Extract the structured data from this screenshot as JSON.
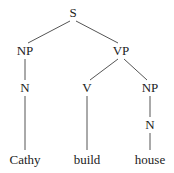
{
  "diagram": {
    "type": "syntax-tree",
    "nodes": [
      {
        "id": "S",
        "label": "S",
        "x": 73,
        "y": 17
      },
      {
        "id": "NP1",
        "label": "NP",
        "x": 25,
        "y": 55
      },
      {
        "id": "VP",
        "label": "VP",
        "x": 121,
        "y": 55
      },
      {
        "id": "N1",
        "label": "N",
        "x": 25,
        "y": 92
      },
      {
        "id": "V",
        "label": "V",
        "x": 87,
        "y": 92
      },
      {
        "id": "NP2",
        "label": "NP",
        "x": 150,
        "y": 92
      },
      {
        "id": "N2",
        "label": "N",
        "x": 150,
        "y": 129
      },
      {
        "id": "W1",
        "label": "Cathy",
        "x": 25,
        "y": 164
      },
      {
        "id": "W2",
        "label": "build",
        "x": 87,
        "y": 164
      },
      {
        "id": "W3",
        "label": "house",
        "x": 150,
        "y": 164
      }
    ],
    "edges": [
      {
        "from": "S",
        "to": "NP1",
        "x1": 70,
        "y1": 21,
        "x2": 28,
        "y2": 43
      },
      {
        "from": "S",
        "to": "VP",
        "x1": 76,
        "y1": 21,
        "x2": 118,
        "y2": 43
      },
      {
        "from": "NP1",
        "to": "N1",
        "x1": 25,
        "y1": 59,
        "x2": 25,
        "y2": 80
      },
      {
        "from": "VP",
        "to": "V",
        "x1": 118,
        "y1": 59,
        "x2": 90,
        "y2": 80
      },
      {
        "from": "VP",
        "to": "NP2",
        "x1": 124,
        "y1": 59,
        "x2": 147,
        "y2": 80
      },
      {
        "from": "N1",
        "to": "W1",
        "x1": 25,
        "y1": 96,
        "x2": 25,
        "y2": 150
      },
      {
        "from": "V",
        "to": "W2",
        "x1": 87,
        "y1": 96,
        "x2": 87,
        "y2": 150
      },
      {
        "from": "NP2",
        "to": "N2",
        "x1": 150,
        "y1": 96,
        "x2": 150,
        "y2": 117
      },
      {
        "from": "N2",
        "to": "W3",
        "x1": 150,
        "y1": 133,
        "x2": 150,
        "y2": 150
      }
    ]
  }
}
